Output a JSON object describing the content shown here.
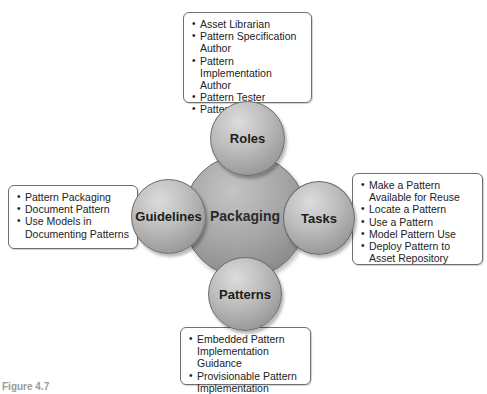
{
  "diagram": {
    "center": {
      "label": "Packaging"
    },
    "satellites": {
      "roles": {
        "label": "Roles",
        "items": [
          "Asset Librarian",
          "Pattern Specification Author",
          "Pattern Implementation Author",
          "Pattern Tester",
          "Pattern User"
        ]
      },
      "guidelines": {
        "label": "Guidelines",
        "items": [
          "Pattern Packaging",
          "Document Pattern",
          "Use Models in Documenting Patterns"
        ]
      },
      "tasks": {
        "label": "Tasks",
        "items": [
          "Make a Pattern Available for Reuse",
          "Locate a Pattern",
          "Use a Pattern",
          "Model Pattern Use",
          "Deploy Pattern to Asset Repository"
        ]
      },
      "patterns": {
        "label": "Patterns",
        "items": [
          "Embedded Pattern Implementation Guidance",
          "Provisionable Pattern Implementation"
        ]
      }
    },
    "caption": "Figure 4.7"
  },
  "colors": {
    "circle_fill": "#a6a6a6",
    "box_border": "#6f6f6f",
    "text": "#1a1a1a"
  }
}
